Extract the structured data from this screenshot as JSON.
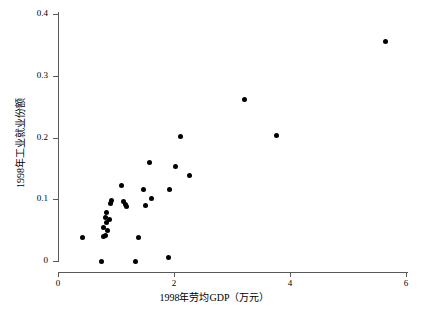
{
  "chart_data": {
    "type": "scatter",
    "title": "",
    "xlabel": "1998年劳均GDP（万元）",
    "ylabel": "1998年工业就业份额",
    "xlim": [
      0,
      6.05
    ],
    "ylim": [
      0,
      0.405
    ],
    "xticks": [
      0,
      2,
      4,
      6
    ],
    "xticklabels": [
      "0",
      "2",
      "4",
      "6"
    ],
    "yticks": [
      0,
      0.1,
      0.2,
      0.3,
      0.4
    ],
    "yticklabels": [
      "0",
      "0.1",
      "0.2",
      "0.3",
      "0.4"
    ],
    "grid": false,
    "legend": null,
    "marker": "filled-circle",
    "marker_color": "#000000",
    "points": [
      {
        "x": 0.43,
        "y": 0.038
      },
      {
        "x": 0.75,
        "y": 0.0
      },
      {
        "x": 0.78,
        "y": 0.04
      },
      {
        "x": 0.79,
        "y": 0.055
      },
      {
        "x": 0.82,
        "y": 0.041
      },
      {
        "x": 0.82,
        "y": 0.07
      },
      {
        "x": 0.83,
        "y": 0.078
      },
      {
        "x": 0.84,
        "y": 0.063
      },
      {
        "x": 0.85,
        "y": 0.05
      },
      {
        "x": 0.88,
        "y": 0.068
      },
      {
        "x": 0.9,
        "y": 0.093
      },
      {
        "x": 0.93,
        "y": 0.098
      },
      {
        "x": 1.1,
        "y": 0.123
      },
      {
        "x": 1.13,
        "y": 0.096
      },
      {
        "x": 1.16,
        "y": 0.092
      },
      {
        "x": 1.18,
        "y": 0.088
      },
      {
        "x": 1.33,
        "y": 0.0
      },
      {
        "x": 1.38,
        "y": 0.038
      },
      {
        "x": 1.47,
        "y": 0.116
      },
      {
        "x": 1.5,
        "y": 0.09
      },
      {
        "x": 1.57,
        "y": 0.16
      },
      {
        "x": 1.62,
        "y": 0.101
      },
      {
        "x": 1.9,
        "y": 0.005
      },
      {
        "x": 1.93,
        "y": 0.115
      },
      {
        "x": 2.02,
        "y": 0.153
      },
      {
        "x": 2.12,
        "y": 0.202
      },
      {
        "x": 2.27,
        "y": 0.138
      },
      {
        "x": 3.22,
        "y": 0.262
      },
      {
        "x": 3.77,
        "y": 0.203
      },
      {
        "x": 5.65,
        "y": 0.355
      }
    ]
  }
}
